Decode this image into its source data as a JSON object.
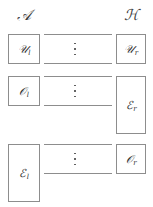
{
  "figure": {
    "type": "diagram",
    "columns": {
      "left": {
        "header": "ᴀ̵",
        "header_text": "𝒜"
      },
      "right": {
        "header_text": "ℋ"
      }
    },
    "headers": {
      "left": "𝒜",
      "right": "ℋ"
    },
    "nodes": [
      {
        "id": "u-left",
        "base": "𝒰",
        "sub": "l",
        "column": "left",
        "row": 1
      },
      {
        "id": "u-right",
        "base": "𝒰",
        "sub": "r",
        "column": "right",
        "row": 1
      },
      {
        "id": "o-left",
        "base": "𝒪",
        "sub": "l",
        "column": "left",
        "row": 2
      },
      {
        "id": "e-right",
        "base": "ℰ",
        "sub": "r",
        "column": "right",
        "row": 2
      },
      {
        "id": "e-left",
        "base": "ℰ",
        "sub": "l",
        "column": "left",
        "row": 3
      },
      {
        "id": "o-right",
        "base": "𝒪",
        "sub": "r",
        "column": "right",
        "row": 3
      }
    ],
    "connectors": [
      {
        "row": 1,
        "lines": 2,
        "ellipsis": "⋮"
      },
      {
        "row": 2,
        "lines": 2,
        "ellipsis": "⋮"
      },
      {
        "row": 3,
        "lines": 2,
        "ellipsis": "⋮"
      }
    ],
    "colors": {
      "background": "#ffffff",
      "stroke": "#8d8d8d",
      "text": "#2f2f2f"
    }
  }
}
